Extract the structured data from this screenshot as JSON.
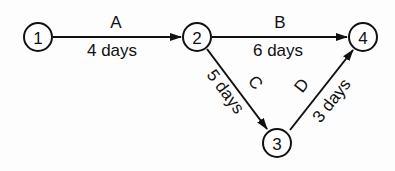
{
  "diagram": {
    "type": "activity-on-arrow network",
    "nodes": [
      {
        "id": "1",
        "label": "1",
        "x": 38,
        "y": 37
      },
      {
        "id": "2",
        "label": "2",
        "x": 197,
        "y": 37
      },
      {
        "id": "3",
        "label": "3",
        "x": 277,
        "y": 143
      },
      {
        "id": "4",
        "label": "4",
        "x": 363,
        "y": 37
      }
    ],
    "edges": [
      {
        "from": "1",
        "to": "2",
        "activity": "A",
        "duration": "4 days"
      },
      {
        "from": "2",
        "to": "4",
        "activity": "B",
        "duration": "6 days"
      },
      {
        "from": "2",
        "to": "3",
        "activity": "C",
        "duration": "5 days"
      },
      {
        "from": "3",
        "to": "4",
        "activity": "D",
        "duration": "3 days"
      }
    ]
  }
}
